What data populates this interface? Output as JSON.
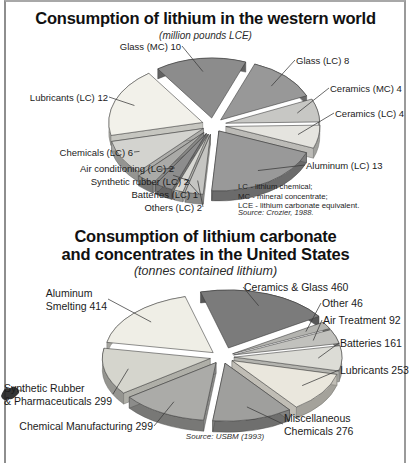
{
  "figure": {
    "kind": "scanned book figure with two exploded 3D pie charts",
    "border_color": "#8e8e8e",
    "background": "#ffffff"
  },
  "chart_data": [
    {
      "type": "pie",
      "style": "exploded-3d",
      "title": "Consumption of lithium in the western world",
      "subtitle": "(million pounds LCE)",
      "units": "million pounds LCE",
      "source": "Source: Crozier, 1988.",
      "abbreviations": [
        "LC - lithium chemical;",
        "MC - mineral concentrate;",
        "LCE - lithium carbonate equivalent."
      ],
      "total": 64,
      "slices": [
        {
          "label": "Glass (MC)",
          "value": 10,
          "color": "#8c8c8c"
        },
        {
          "label": "Glass (LC)",
          "value": 8,
          "color": "#989898"
        },
        {
          "label": "Ceramics (MC)",
          "value": 4,
          "color": "#c7c7c4"
        },
        {
          "label": "Ceramics (LC)",
          "value": 4,
          "color": "#e5e4df"
        },
        {
          "label": "Aluminum (LC)",
          "value": 13,
          "color": "#999999"
        },
        {
          "label": "Others (LC)",
          "value": 2,
          "color": "#c5c5c2"
        },
        {
          "label": "Batteries (LC)",
          "value": 1,
          "color": "#d8d8d3"
        },
        {
          "label": "Synthetic rubber (LC)",
          "value": 2,
          "color": "#8d8d8d"
        },
        {
          "label": "Air conditioning (LC)",
          "value": 2,
          "color": "#aaaaa7"
        },
        {
          "label": "Chemicals (LC)",
          "value": 6,
          "color": "#d3d3cf"
        },
        {
          "label": "Lubricants (LC)",
          "value": 12,
          "color": "#f2f1ea"
        }
      ]
    },
    {
      "type": "pie",
      "style": "exploded-3d",
      "title": "Consumption of lithium carbonate and concentrates in the United States",
      "title_lines": [
        "Consumption of lithium carbonate",
        "and concentrates in the United States"
      ],
      "subtitle": "(tonnes contained lithium)",
      "units": "tonnes contained lithium",
      "source": "Source: USBM (1993)",
      "total": 2300,
      "slices": [
        {
          "label": "Ceramics & Glass",
          "value": 460,
          "color": "#7b7b7b"
        },
        {
          "label": "Other",
          "value": 46,
          "color": "#b3b3af"
        },
        {
          "label": "Air Treatment",
          "value": 92,
          "color": "#c1c1bd"
        },
        {
          "label": "Batteries",
          "value": 161,
          "color": "#dcdcd6"
        },
        {
          "label": "Lubricants",
          "value": 253,
          "color": "#eae7dd"
        },
        {
          "label": "Miscellaneous Chemicals",
          "value": 276,
          "color": "#9f9f9d"
        },
        {
          "label": "Chemical Manufacturing",
          "value": 299,
          "color": "#ababa8"
        },
        {
          "label": "Synthetic Rubber & Pharmaceuticals",
          "value": 299,
          "color": "#d5d5cd"
        },
        {
          "label": "Aluminum Smelting",
          "value": 414,
          "color": "#efeee6"
        }
      ]
    }
  ]
}
